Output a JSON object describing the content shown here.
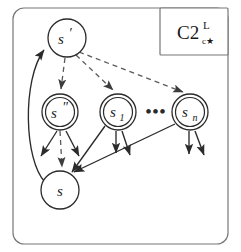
{
  "figure": {
    "corner_label": {
      "base": "C2",
      "superscript": "L",
      "subscript": "c★"
    },
    "ellipsis": "•••",
    "nodes": [
      {
        "id": "s-prime",
        "label": "s",
        "decoration": "′",
        "shape": "single-circle",
        "cx": 67,
        "cy": 38,
        "r": 19
      },
      {
        "id": "s-double",
        "label": "s",
        "decoration": "″",
        "shape": "double-circle",
        "cx": 60,
        "cy": 112,
        "r": 18
      },
      {
        "id": "s-1",
        "label": "s",
        "decoration": "1",
        "shape": "double-circle",
        "cx": 118,
        "cy": 112,
        "r": 18
      },
      {
        "id": "s-n",
        "label": "s",
        "decoration": "n",
        "shape": "double-circle",
        "cx": 190,
        "cy": 112,
        "r": 18
      },
      {
        "id": "s",
        "label": "s",
        "decoration": "",
        "shape": "single-circle",
        "cx": 60,
        "cy": 190,
        "r": 19
      }
    ],
    "edges": [
      {
        "id": "sprime-to-sdouble",
        "from": "s-prime",
        "to": "s-double",
        "style": "dashed"
      },
      {
        "id": "sprime-to-s1",
        "from": "s-prime",
        "to": "s-1",
        "style": "dashed"
      },
      {
        "id": "sprime-to-sn",
        "from": "s-prime",
        "to": "s-n",
        "style": "dashed"
      },
      {
        "id": "sdouble-to-s",
        "from": "s-double",
        "to": "s",
        "style": "dashed"
      },
      {
        "id": "s-to-sprime",
        "from": "s",
        "to": "s-prime",
        "style": "solid-curved"
      },
      {
        "id": "s1-to-s",
        "from": "s-1",
        "to": "s",
        "style": "solid"
      },
      {
        "id": "sn-to-s",
        "from": "s-n",
        "to": "s",
        "style": "solid"
      }
    ],
    "stub_arrows": [
      {
        "id": "sdouble-stub-left",
        "from": "s-double"
      },
      {
        "id": "sdouble-stub-right",
        "from": "s-double"
      },
      {
        "id": "s1-stub-left",
        "from": "s-1"
      },
      {
        "id": "s1-stub-right",
        "from": "s-1"
      },
      {
        "id": "sn-stub-left",
        "from": "s-n"
      },
      {
        "id": "sn-stub-right",
        "from": "s-n"
      }
    ],
    "colors": {
      "stroke": "#2b2b2b",
      "dashed_stroke": "#5a5a5a",
      "frame": "#777777",
      "background": "#ffffff"
    }
  }
}
